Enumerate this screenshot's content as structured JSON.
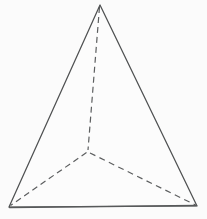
{
  "figure": {
    "name": "tetrahedron-wireframe",
    "type": "line-drawing",
    "title": "",
    "caption": "",
    "background_color": "#fbfbfb",
    "line_color": "#4f5152",
    "hidden_line_color": "#5c5e5f",
    "canvas": {
      "width": 207,
      "height": 219
    },
    "vertices": {
      "apex": {
        "label": "",
        "x": 100,
        "y": 5
      },
      "front_left": {
        "label": "",
        "x": 9,
        "y": 207
      },
      "front_right": {
        "label": "",
        "x": 197,
        "y": 206
      },
      "back": {
        "label": "",
        "x": 88,
        "y": 152
      }
    },
    "edges": [
      {
        "name": "apex-to-front-left",
        "style": "solid",
        "from": "apex",
        "to": "front_left"
      },
      {
        "name": "apex-to-front-right",
        "style": "solid",
        "from": "apex",
        "to": "front_right"
      },
      {
        "name": "front-left-to-front-right",
        "style": "solid",
        "from": "front_left",
        "to": "front_right"
      },
      {
        "name": "apex-to-back",
        "style": "dashed",
        "from": "apex",
        "to": "back"
      },
      {
        "name": "back-to-front-left",
        "style": "dashed",
        "from": "back",
        "to": "front_left"
      },
      {
        "name": "back-to-front-right",
        "style": "dashed",
        "from": "back",
        "to": "front_right"
      }
    ],
    "geometry": {
      "solid_outline_path": "M 100 5 L 9 207 L 197 206 Z",
      "hidden_apex_path": "M 99.5 7 L 88 150",
      "hidden_left_path": "M 86.5 152.5 L 10.5 205.5",
      "hidden_right_path": "M 90 153 L 195.5 205",
      "base_edge_path": "M 9.5 207.5 L 196.5 205.5"
    }
  }
}
